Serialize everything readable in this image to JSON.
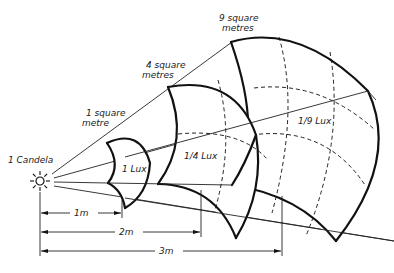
{
  "diagram": {
    "source": {
      "label": "1 Candela",
      "icon": "sun-icon"
    },
    "surfaces": [
      {
        "area_label_line1": "1 square",
        "area_label_line2": "metre",
        "illuminance_label": "1 Lux",
        "distance_label": "1m"
      },
      {
        "area_label_line1": "4 square",
        "area_label_line2": "metres",
        "illuminance_label": "1/4 Lux",
        "distance_label": "2m"
      },
      {
        "area_label_line1": "9 square",
        "area_label_line2": "metres",
        "illuminance_label": "1/9 Lux",
        "distance_label": "3m"
      }
    ]
  }
}
